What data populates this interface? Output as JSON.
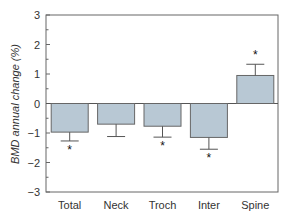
{
  "chart_data": {
    "type": "bar",
    "title": "",
    "xlabel": "",
    "ylabel": "BMD annual change (%)",
    "categories": [
      "Total",
      "Neck",
      "Troch",
      "Inter",
      "Spine"
    ],
    "values": [
      -0.97,
      -0.7,
      -0.77,
      -1.15,
      0.95
    ],
    "error": [
      0.3,
      0.42,
      0.37,
      0.4,
      0.38
    ],
    "significant": [
      true,
      false,
      true,
      true,
      true
    ],
    "significance_marker": "*",
    "ylim": [
      -3,
      3
    ],
    "yticks": [
      -3,
      -2,
      -1,
      0,
      1,
      2,
      3
    ],
    "grid": false,
    "legend": null,
    "bar_color": "#b8c8d4",
    "bar_edge_color": "#666666"
  }
}
